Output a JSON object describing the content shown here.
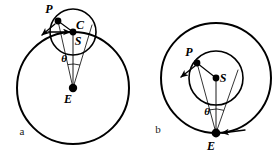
{
  "figure": {
    "type": "astronomical-geometry-diagram",
    "background_color": "#ffffff",
    "stroke_color": "#000000"
  },
  "panels": [
    {
      "id": "a",
      "letter": "a",
      "letter_x": 22,
      "letter_y": 135,
      "letter_size": 11,
      "deferent": {
        "name": "outer-circle",
        "cx": 73,
        "cy": 88,
        "r": 56,
        "stroke_width": 2.0
      },
      "epicycle": {
        "name": "epicycle-circle",
        "cx": 73,
        "cy": 32,
        "r": 23,
        "stroke_width": 1.6
      },
      "points": [
        {
          "id": "P",
          "label": "P",
          "x": 58,
          "y": 21,
          "r": 3.4,
          "label_x": 49,
          "label_y": 13,
          "label_size": 12
        },
        {
          "id": "C",
          "label": "C",
          "x": 73,
          "y": 32,
          "r": 3.4,
          "label_x": 80,
          "label_y": 29,
          "label_size": 12
        },
        {
          "id": "S",
          "label": "S",
          "x": 73,
          "y": 39,
          "r": 0,
          "label_x": 78,
          "label_y": 45,
          "label_size": 12
        },
        {
          "id": "E",
          "label": "E",
          "x": 73,
          "y": 88,
          "r": 4.2,
          "label_x": 68,
          "label_y": 103,
          "label_size": 12
        }
      ],
      "lines": [
        {
          "name": "line-C-to-P",
          "x1": 73,
          "y1": 32,
          "x2": 58,
          "y2": 21,
          "width": 1.1
        },
        {
          "name": "line-E-to-P",
          "x1": 73,
          "y1": 88,
          "x2": 58,
          "y2": 21,
          "width": 0.8
        },
        {
          "name": "line-E-to-C",
          "x1": 73,
          "y1": 88,
          "x2": 73,
          "y2": 32,
          "width": 0.9
        },
        {
          "name": "line-E-to-right-limb",
          "x1": 73,
          "y1": 88,
          "x2": 92,
          "y2": 25,
          "width": 0.8
        }
      ],
      "angle_arc": {
        "name": "theta-arc",
        "cx": 73,
        "cy": 88,
        "r": 24,
        "label": "θ",
        "label_x": 64,
        "label_y": 62,
        "label_size": 11
      },
      "arrows": [
        {
          "name": "tangent-arrow-at-P",
          "x1": 55,
          "y1": 24,
          "x2": 42,
          "y2": 35,
          "width": 1.3
        },
        {
          "name": "horizontal-motion-arrow",
          "x1": 48,
          "y1": 32,
          "x2": 70,
          "y2": 32,
          "width": 1.3
        }
      ]
    },
    {
      "id": "b",
      "letter": "b",
      "letter_x": 158,
      "letter_y": 133,
      "letter_size": 11,
      "deferent": {
        "name": "outer-circle",
        "cx": 216,
        "cy": 78,
        "r": 55,
        "stroke_width": 2.0
      },
      "epicycle": {
        "name": "inner-circle",
        "cx": 216,
        "cy": 78,
        "r": 27,
        "stroke_width": 1.6
      },
      "points": [
        {
          "id": "P",
          "label": "P",
          "x": 197,
          "y": 63,
          "r": 3.4,
          "label_x": 189,
          "label_y": 56,
          "label_size": 12
        },
        {
          "id": "S",
          "label": "S",
          "x": 216,
          "y": 78,
          "r": 3.4,
          "label_x": 223,
          "label_y": 82,
          "label_size": 12
        },
        {
          "id": "E",
          "label": "E",
          "x": 216,
          "y": 133,
          "r": 4.4,
          "label_x": 211,
          "label_y": 150,
          "label_size": 12
        }
      ],
      "lines": [
        {
          "name": "line-S-to-P",
          "x1": 216,
          "y1": 78,
          "x2": 197,
          "y2": 63,
          "width": 1.1
        },
        {
          "name": "line-E-to-P",
          "x1": 216,
          "y1": 133,
          "x2": 197,
          "y2": 63,
          "width": 0.8
        },
        {
          "name": "line-E-to-S",
          "x1": 216,
          "y1": 133,
          "x2": 216,
          "y2": 78,
          "width": 0.9
        },
        {
          "name": "line-E-to-right-limb",
          "x1": 216,
          "y1": 133,
          "x2": 238,
          "y2": 70,
          "width": 0.8
        }
      ],
      "angle_arc": {
        "name": "theta-arc",
        "cx": 216,
        "cy": 133,
        "r": 24,
        "label": "θ",
        "label_x": 207,
        "label_y": 115,
        "label_size": 11
      },
      "arrows": [
        {
          "name": "tangent-arrow-at-P",
          "x1": 195,
          "y1": 66,
          "x2": 181,
          "y2": 77,
          "width": 1.3
        },
        {
          "name": "orbital-motion-arrow",
          "x1": 245,
          "y1": 130,
          "x2": 222,
          "y2": 133,
          "width": 1.3
        }
      ]
    }
  ]
}
